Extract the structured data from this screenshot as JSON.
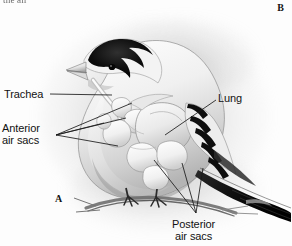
{
  "figure": {
    "cropped_caption": "the air",
    "panels": [
      {
        "id": "a",
        "letter": "A"
      },
      {
        "id": "b",
        "letter": "B"
      }
    ],
    "colors": {
      "ink": "#121212",
      "leader_line": "#1a1a1a",
      "plumage_dark": "#101010",
      "plumage_light": "#f2f2f2",
      "background": "#fdfdfd",
      "halo_grey": "#9a9a9a",
      "organ_fill": "#f4f4f4",
      "organ_shade": "#c9c9c9"
    }
  },
  "labels": {
    "trachea": {
      "text": "Trachea"
    },
    "anterior_air_sacs": {
      "line1": "Anterior",
      "line2": "air sacs"
    },
    "lung": {
      "text": "Lung"
    },
    "posterior_air_sacs": {
      "line1": "Posterior",
      "line2": "air sacs"
    }
  }
}
